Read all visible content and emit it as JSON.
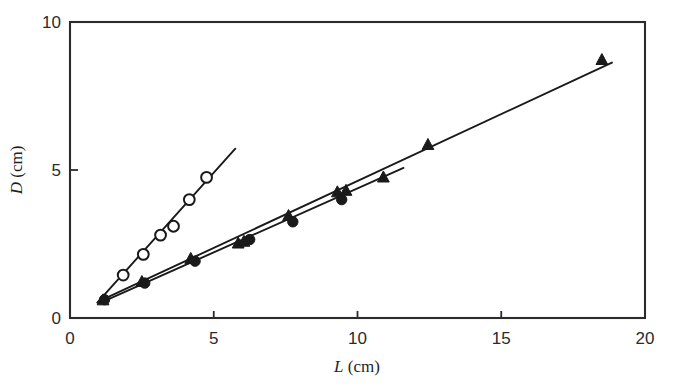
{
  "figure": {
    "background_color": "#ffffff",
    "ink_color": "#1a1a1a",
    "frame_color": "#2b2b2b"
  },
  "axes": {
    "x": {
      "label_var": "L",
      "label_unit": "(cm)",
      "label_full": "L (cm)",
      "min": 0,
      "max": 20,
      "ticks": [
        0,
        5,
        10,
        15,
        20
      ],
      "tick_labels": [
        "0",
        "5",
        "10",
        "15",
        "20"
      ]
    },
    "y": {
      "label_var": "D",
      "label_unit": "(cm)",
      "label_full": "D (cm)",
      "min": 0,
      "max": 10,
      "ticks": [
        0,
        5,
        10
      ],
      "tick_labels": [
        "0",
        "5",
        "10"
      ]
    }
  },
  "chart_data": {
    "type": "scatter",
    "title": "",
    "xlabel": "L (cm)",
    "ylabel": "D (cm)",
    "xlim": [
      0,
      20
    ],
    "ylim": [
      0,
      10
    ],
    "xticks": [
      0,
      5,
      10,
      15,
      20
    ],
    "yticks": [
      0,
      5,
      10
    ],
    "grid": false,
    "legend": "none",
    "series": [
      {
        "name": "open-circles",
        "marker": "open-circle",
        "marker_fill": "#ffffff",
        "marker_stroke": "#1a1a1a",
        "line": true,
        "slope": 1.08,
        "intercept": -0.5,
        "fit_x": [
          0.95,
          5.75
        ],
        "fit_y": [
          0.52,
          5.72
        ],
        "x": [
          1.85,
          2.55,
          3.15,
          3.6,
          4.15,
          4.75
        ],
        "y": [
          1.45,
          2.15,
          2.8,
          3.1,
          4.0,
          4.75
        ]
      },
      {
        "name": "filled-triangles",
        "marker": "filled-triangle",
        "marker_fill": "#1a1a1a",
        "marker_stroke": "#1a1a1a",
        "line": true,
        "slope": 0.452,
        "intercept": 0.11,
        "fit_x": [
          1.0,
          18.85
        ],
        "fit_y": [
          0.56,
          8.63
        ],
        "x": [
          1.15,
          2.5,
          4.2,
          5.85,
          6.05,
          7.6,
          9.3,
          9.6,
          10.9,
          12.45,
          18.5
        ],
        "y": [
          0.6,
          1.22,
          2.0,
          2.52,
          2.58,
          3.45,
          4.25,
          4.3,
          4.75,
          5.85,
          8.72
        ]
      },
      {
        "name": "filled-circles",
        "marker": "filled-circle",
        "marker_fill": "#1a1a1a",
        "marker_stroke": "#1a1a1a",
        "line": true,
        "slope": 0.432,
        "intercept": 0.06,
        "fit_x": [
          1.05,
          11.6
        ],
        "fit_y": [
          0.51,
          5.07
        ],
        "x": [
          1.2,
          2.6,
          4.35,
          6.25,
          7.75,
          9.45
        ],
        "y": [
          0.62,
          1.18,
          1.92,
          2.65,
          3.25,
          4.0
        ]
      }
    ]
  }
}
